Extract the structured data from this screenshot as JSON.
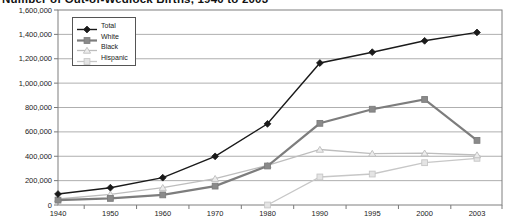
{
  "chart_data": {
    "type": "line",
    "title": "Number of Out-of-Wedlock Births, 1940 to 2003",
    "categories": [
      "1940",
      "1950",
      "1960",
      "1970",
      "1980",
      "1990",
      "1995",
      "2000",
      "2003"
    ],
    "series": [
      {
        "name": "Total",
        "marker": "diamond",
        "color": "#1a1a1a",
        "fill": "#1a1a1a",
        "line_width": 1.4,
        "values": [
          90000,
          142000,
          224000,
          399000,
          666000,
          1165000,
          1254000,
          1347000,
          1416000
        ]
      },
      {
        "name": "White",
        "marker": "square",
        "color": "#7d7d7d",
        "fill": "#8a8a8a",
        "line_width": 2.2,
        "values": [
          40000,
          54000,
          83000,
          155000,
          320000,
          670000,
          786000,
          866000,
          530000
        ]
      },
      {
        "name": "Black",
        "marker": "triangle",
        "color": "#bdbdbd",
        "fill": "#ececec",
        "line_width": 1.3,
        "values": [
          49000,
          88000,
          142000,
          216000,
          326000,
          455000,
          422000,
          425000,
          410000
        ]
      },
      {
        "name": "Hispanic",
        "marker": "square",
        "color": "#c7c7c7",
        "fill": "#e4e4e4",
        "line_width": 1.3,
        "values": [
          null,
          null,
          null,
          null,
          0,
          230000,
          254000,
          347000,
          383000
        ]
      }
    ],
    "xlabel": "",
    "ylabel": "",
    "ylim": [
      0,
      1600000
    ],
    "ytick_step": 200000,
    "ytick_labels": [
      "0",
      "200,000",
      "400,000",
      "600,000",
      "800,000",
      "1,000,000",
      "1,200,000",
      "1,400,000",
      "1,600,000"
    ],
    "grid": "horizontal",
    "legend_position": "top-left",
    "colors": {
      "gridline": "#9a9a9a",
      "frame": "#7f7f7f",
      "tick": "#555555",
      "text": "#222222"
    }
  }
}
